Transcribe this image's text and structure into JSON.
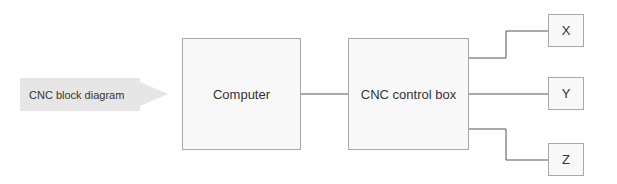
{
  "label": {
    "text": "CNC block diagram"
  },
  "nodes": {
    "computer": "Computer",
    "control_box": "CNC control box",
    "x": "X",
    "y": "Y",
    "z": "Z"
  },
  "edges": [
    [
      "Computer",
      "CNC control box"
    ],
    [
      "CNC control box",
      "X"
    ],
    [
      "CNC control box",
      "Y"
    ],
    [
      "CNC control box",
      "Z"
    ]
  ],
  "colors": {
    "box_fill": "#f8f8f8",
    "box_border": "#a8a8a8",
    "line": "#555555",
    "tag_fill": "#e6e6e6"
  }
}
